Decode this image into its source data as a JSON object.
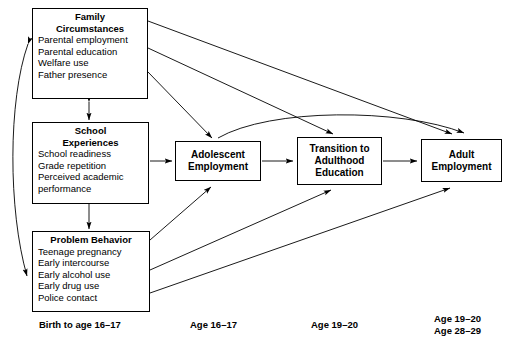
{
  "diagram": {
    "stroke_color": "#000000",
    "background_color": "#ffffff"
  },
  "nodes": {
    "family": {
      "title_line1": "Family",
      "title_line2": "Circumstances",
      "items": [
        "Parental employment",
        "Parental education",
        "Welfare use",
        "Father presence"
      ]
    },
    "school": {
      "title_line1": "School",
      "title_line2": "Experiences",
      "items": [
        "School readiness",
        "Grade repetition",
        "Perceived academic",
        "performance"
      ]
    },
    "problem": {
      "title_line1": "Problem Behavior",
      "title_line2": "",
      "items": [
        "Teenage pregnancy",
        "Early intercourse",
        "Early alcohol use",
        "Early drug use",
        "Police contact"
      ]
    },
    "adolescent_employment": {
      "title_line1": "Adolescent",
      "title_line2": "Employment"
    },
    "transition": {
      "title_line1": "Transition to",
      "title_line2": "Adulthood",
      "title_line3": "Education"
    },
    "adult_employment": {
      "title_line1": "Adult",
      "title_line2": "Employment"
    }
  },
  "timeline": {
    "birth": "Birth to age 16–17",
    "adolescent": "Age 16–17",
    "transition": "Age 19–20",
    "adult_line1": "Age 19–20",
    "adult_line2": "Age 28–29"
  }
}
